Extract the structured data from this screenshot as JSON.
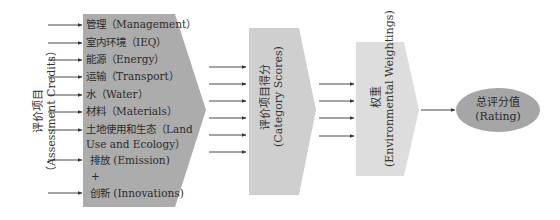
{
  "colors": {
    "credits_block": "#acacac",
    "scores_block": "#cfcfcf",
    "weights_block": "#dddddd",
    "rating_ellipse": "#a6a6a6",
    "arrow": "#333333"
  },
  "assessment_credits": {
    "side_label_cn": "评价项目",
    "side_label_en": "（Assessment Credits）",
    "items": [
      {
        "label": "管理（Management）"
      },
      {
        "label": "室内环境（IEQ）"
      },
      {
        "label": "能源（Energy）"
      },
      {
        "label": "运输（Transport）"
      },
      {
        "label": "水（Water）"
      },
      {
        "label": "材料（Materials）"
      },
      {
        "label": "土地使用和生态（Land",
        "label2": "Use and Ecology）"
      },
      {
        "label": "排放 (Emission)"
      },
      {
        "label": "创新 (Innovations)"
      }
    ],
    "plus_sign": "+"
  },
  "category_scores": {
    "label_cn": "评价项目得分",
    "label_en": "(Category Scores)"
  },
  "weightings": {
    "label_cn": "权重",
    "label_en": "(Environmental Weightings)"
  },
  "rating": {
    "label_cn": "总评分值",
    "label_en": "(Rating)"
  }
}
